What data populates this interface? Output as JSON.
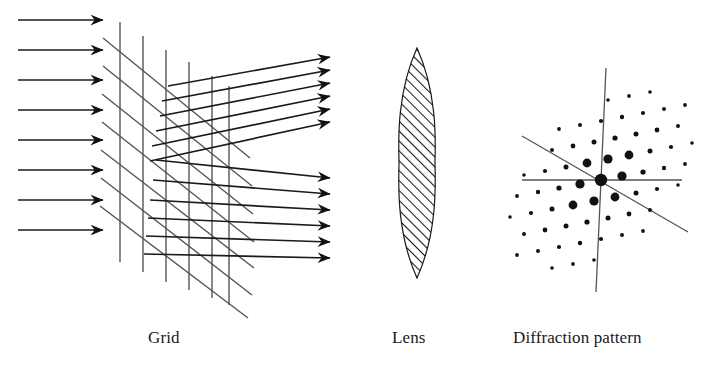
{
  "figure": {
    "stroke_color": "#1a1a1a",
    "grid_line_color": "#555555",
    "background": "#ffffff"
  },
  "captions": {
    "grid": "Grid",
    "lens": "Lens",
    "diffraction": "Diffraction pattern"
  },
  "incoming_beam": {
    "name": "incident-plane-wave",
    "count": 8,
    "x_start": 18,
    "x_end": 103,
    "y_values": [
      20,
      50,
      80,
      110,
      140,
      170,
      200,
      230
    ]
  },
  "grid_object": {
    "name": "diffraction-grid",
    "vertical_lines": [
      {
        "x": 120,
        "y_top": 22,
        "y_bottom": 262
      },
      {
        "x": 143,
        "y_top": 36,
        "y_bottom": 272
      },
      {
        "x": 166,
        "y_top": 50,
        "y_bottom": 282
      },
      {
        "x": 189,
        "y_top": 62,
        "y_bottom": 290
      },
      {
        "x": 212,
        "y_top": 76,
        "y_bottom": 298
      },
      {
        "x": 229,
        "y_top": 86,
        "y_bottom": 305
      }
    ],
    "diagonal_lines": [
      {
        "x1": 103,
        "y1": 38,
        "x2": 250,
        "y2": 158
      },
      {
        "x1": 103,
        "y1": 66,
        "x2": 252,
        "y2": 186
      },
      {
        "x1": 102,
        "y1": 94,
        "x2": 253,
        "y2": 214
      },
      {
        "x1": 102,
        "y1": 122,
        "x2": 254,
        "y2": 242
      },
      {
        "x1": 101,
        "y1": 150,
        "x2": 254,
        "y2": 268
      },
      {
        "x1": 101,
        "y1": 178,
        "x2": 252,
        "y2": 295
      },
      {
        "x1": 100,
        "y1": 206,
        "x2": 248,
        "y2": 318
      }
    ]
  },
  "upper_diffracted_beam": {
    "name": "upper-diffracted-order",
    "count": 6,
    "x_end": 330,
    "y_end_values": [
      57,
      70,
      83,
      96,
      109,
      122
    ],
    "x_start_values": [
      168,
      162,
      160,
      156,
      152,
      150
    ],
    "y_start_values": [
      86,
      101,
      116,
      131,
      146,
      161
    ]
  },
  "lower_diffracted_beam": {
    "name": "lower-diffracted-order",
    "count": 6,
    "x_end": 330,
    "y_end_values": [
      178,
      194,
      210,
      226,
      242,
      258
    ],
    "x_start_values": [
      156,
      153,
      150,
      148,
      146,
      144
    ],
    "y_start_values": [
      160,
      180,
      200,
      218,
      236,
      254
    ]
  },
  "lens": {
    "name": "biconvex-lens",
    "center_x": 417,
    "top_y": 48,
    "bottom_y": 278,
    "half_width": 18,
    "hatch_spacing": 7,
    "hatch_angle_deg": 45
  },
  "diffraction_pattern": {
    "name": "reciprocal-lattice",
    "center": {
      "x": 601,
      "y": 180
    },
    "lattice_vector_a": {
      "dx": 21,
      "dy": -4
    },
    "lattice_vector_b": {
      "dx": -7,
      "dy": 21
    },
    "axis_lines": [
      {
        "name": "horizontal-axis",
        "x1": 522,
        "y1": 180,
        "x2": 682,
        "y2": 180
      },
      {
        "name": "vertical-axis",
        "x1": 606,
        "y1": 68,
        "x2": 596,
        "y2": 292
      },
      {
        "name": "diagonal-axis",
        "x1": 522,
        "y1": 136,
        "x2": 688,
        "y2": 232
      }
    ],
    "spots": [
      {
        "i": 0,
        "j": 0,
        "r": 6.2
      },
      {
        "i": 1,
        "j": 0,
        "r": 4.6
      },
      {
        "i": -1,
        "j": 0,
        "r": 4.6
      },
      {
        "i": 0,
        "j": 1,
        "r": 4.6
      },
      {
        "i": 0,
        "j": -1,
        "r": 4.6
      },
      {
        "i": 1,
        "j": -1,
        "r": 4.4
      },
      {
        "i": -1,
        "j": 1,
        "r": 4.4
      },
      {
        "i": 1,
        "j": 1,
        "r": 4.4
      },
      {
        "i": -1,
        "j": -1,
        "r": 4.4
      },
      {
        "i": 2,
        "j": 0,
        "r": 2.6
      },
      {
        "i": -2,
        "j": 0,
        "r": 2.6
      },
      {
        "i": 0,
        "j": 2,
        "r": 2.6
      },
      {
        "i": 0,
        "j": -2,
        "r": 2.6
      },
      {
        "i": 2,
        "j": -1,
        "r": 2.5
      },
      {
        "i": -2,
        "j": 1,
        "r": 2.5
      },
      {
        "i": 1,
        "j": -2,
        "r": 2.5
      },
      {
        "i": -1,
        "j": 2,
        "r": 2.5
      },
      {
        "i": 2,
        "j": 1,
        "r": 2.5
      },
      {
        "i": -2,
        "j": -1,
        "r": 2.5
      },
      {
        "i": 1,
        "j": 2,
        "r": 2.5
      },
      {
        "i": -1,
        "j": -2,
        "r": 2.5
      },
      {
        "i": 2,
        "j": 2,
        "r": 2.4
      },
      {
        "i": -2,
        "j": -2,
        "r": 2.4
      },
      {
        "i": 2,
        "j": -2,
        "r": 2.4
      },
      {
        "i": -2,
        "j": 2,
        "r": 2.4
      },
      {
        "i": 3,
        "j": 0,
        "r": 2.2
      },
      {
        "i": -3,
        "j": 0,
        "r": 2.2
      },
      {
        "i": 0,
        "j": 3,
        "r": 2.2
      },
      {
        "i": 0,
        "j": -3,
        "r": 2.2
      },
      {
        "i": 3,
        "j": -1,
        "r": 2.1
      },
      {
        "i": -3,
        "j": 1,
        "r": 2.1
      },
      {
        "i": 1,
        "j": -3,
        "r": 2.1
      },
      {
        "i": -1,
        "j": 3,
        "r": 2.1
      },
      {
        "i": 3,
        "j": 1,
        "r": 2.1
      },
      {
        "i": -3,
        "j": -1,
        "r": 2.1
      },
      {
        "i": 1,
        "j": 3,
        "r": 2.1
      },
      {
        "i": -1,
        "j": -3,
        "r": 2.1
      },
      {
        "i": 3,
        "j": 2,
        "r": 2.0
      },
      {
        "i": -3,
        "j": -2,
        "r": 2.0
      },
      {
        "i": 2,
        "j": 3,
        "r": 2.0
      },
      {
        "i": -2,
        "j": -3,
        "r": 2.0
      },
      {
        "i": 3,
        "j": -2,
        "r": 2.0
      },
      {
        "i": -3,
        "j": 2,
        "r": 2.0
      },
      {
        "i": 2,
        "j": -3,
        "r": 2.0
      },
      {
        "i": -2,
        "j": 3,
        "r": 2.0
      },
      {
        "i": 3,
        "j": 3,
        "r": 1.9
      },
      {
        "i": -3,
        "j": -3,
        "r": 1.9
      },
      {
        "i": 3,
        "j": -3,
        "r": 1.9
      },
      {
        "i": -3,
        "j": 3,
        "r": 1.9
      },
      {
        "i": 4,
        "j": 0,
        "r": 1.9
      },
      {
        "i": -4,
        "j": 0,
        "r": 1.9
      },
      {
        "i": 0,
        "j": 4,
        "r": 1.9
      },
      {
        "i": 0,
        "j": -4,
        "r": 1.9
      },
      {
        "i": 4,
        "j": -1,
        "r": 1.8
      },
      {
        "i": -4,
        "j": 1,
        "r": 1.8
      },
      {
        "i": 1,
        "j": -4,
        "r": 1.8
      },
      {
        "i": -1,
        "j": 4,
        "r": 1.8
      },
      {
        "i": 4,
        "j": 1,
        "r": 1.8
      },
      {
        "i": -4,
        "j": -1,
        "r": 1.8
      },
      {
        "i": 1,
        "j": 4,
        "r": 1.8
      },
      {
        "i": -1,
        "j": -4,
        "r": 1.8
      }
    ]
  }
}
